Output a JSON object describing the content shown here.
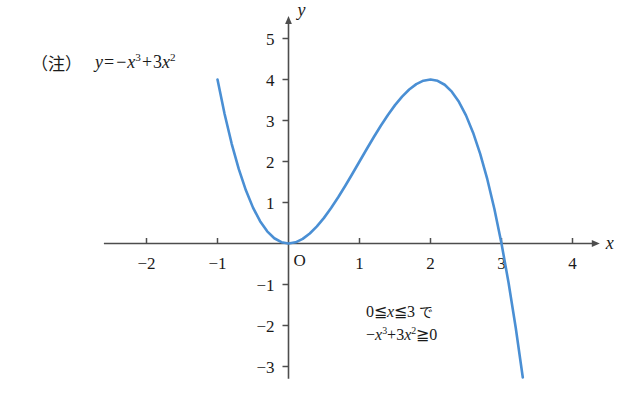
{
  "figure": {
    "note_marker": "（注）",
    "equation": {
      "lhs": "y",
      "eq": "=",
      "term1_sign": "−",
      "term1_base": "x",
      "term1_exp": "3",
      "term2_sign": "+",
      "term2_coef": "3",
      "term2_base": "x",
      "term2_exp": "2",
      "plain": "y = −x³ + 3x²"
    },
    "annotation": {
      "line1": "0≦x≦3 で",
      "line1_parts": {
        "zero": "0",
        "le1": "≦",
        "x": "x",
        "le2": "≦",
        "three": "3",
        "jp": "で"
      },
      "line2": "−x³+3x²≧ 0",
      "line2_parts": {
        "sign": "−",
        "base1": "x",
        "exp1": "3",
        "plus": "+",
        "coef2": "3",
        "base2": "x",
        "exp2": "2",
        "ge": "≧",
        "zero": "0"
      }
    },
    "axes": {
      "x_axis_label": "x",
      "y_axis_label": "y",
      "origin_label": "O",
      "x_ticks": [
        "−2",
        "−1",
        "1",
        "2",
        "3",
        "4"
      ],
      "x_tick_values": [
        -2,
        -1,
        1,
        2,
        3,
        4
      ],
      "y_ticks": [
        "5",
        "4",
        "3",
        "2",
        "1",
        "−1",
        "−2",
        "−3"
      ],
      "y_tick_values": [
        5,
        4,
        3,
        2,
        1,
        -1,
        -2,
        -3
      ],
      "xlim": [
        -2.6,
        4.3
      ],
      "ylim": [
        -3.3,
        5.4
      ]
    },
    "colors": {
      "curve": "#4a8fd4",
      "axis": "#4d4d4d",
      "text": "#1a1a1a",
      "background": "#ffffff"
    }
  },
  "chart_data": {
    "type": "line",
    "title": "",
    "xlabel": "x",
    "ylabel": "y",
    "xlim": [
      -2.6,
      4.3
    ],
    "ylim": [
      -3.3,
      5.4
    ],
    "grid": false,
    "legend": null,
    "equation": "y = -x^3 + 3x^2",
    "domain_drawn": [
      -1.0,
      3.3
    ],
    "series": [
      {
        "name": "y = -x^3 + 3x^2",
        "color": "#4a8fd4",
        "x": [
          -1.0,
          -0.9,
          -0.8,
          -0.7,
          -0.6,
          -0.5,
          -0.4,
          -0.3,
          -0.2,
          -0.1,
          0.0,
          0.1,
          0.2,
          0.3,
          0.4,
          0.5,
          0.6,
          0.7,
          0.8,
          0.9,
          1.0,
          1.1,
          1.2,
          1.3,
          1.4,
          1.5,
          1.6,
          1.7,
          1.8,
          1.9,
          2.0,
          2.1,
          2.2,
          2.3,
          2.4,
          2.5,
          2.6,
          2.7,
          2.8,
          2.9,
          3.0,
          3.1,
          3.2,
          3.3
        ],
        "y": [
          4.0,
          3.159,
          2.432,
          1.813,
          1.296,
          0.875,
          0.544,
          0.297,
          0.128,
          0.031,
          0.0,
          0.029,
          0.112,
          0.243,
          0.416,
          0.625,
          0.864,
          1.127,
          1.408,
          1.701,
          2.0,
          2.299,
          2.592,
          2.873,
          3.136,
          3.375,
          3.584,
          3.757,
          3.888,
          3.971,
          4.0,
          3.969,
          3.872,
          3.703,
          3.456,
          3.125,
          2.704,
          2.187,
          1.568,
          0.841,
          0.0,
          -0.961,
          -2.048,
          -3.267
        ]
      }
    ],
    "key_points": [
      {
        "label": "local minimum",
        "x": 0,
        "y": 0
      },
      {
        "label": "local maximum",
        "x": 2,
        "y": 4
      },
      {
        "label": "x-intercept",
        "x": 3,
        "y": 0
      }
    ]
  }
}
